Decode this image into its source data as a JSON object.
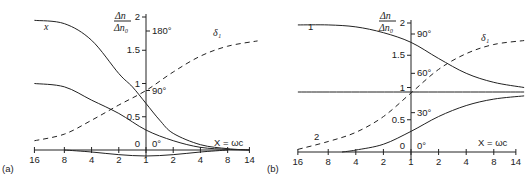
{
  "chart_data": [
    {
      "panel_label": "(a)",
      "type": "line",
      "xlabel": "X = ωc",
      "x_tick_labels": [
        "16",
        "8",
        "4",
        "2",
        "1",
        "2",
        "4",
        "8",
        "14"
      ],
      "x_ticks_note": "log scale, reciprocal left of 1, direct right of 1",
      "y_label": "Δn / Δn₀",
      "y_tick_labels": [
        "0",
        "0.5",
        "1",
        "1.5",
        "2"
      ],
      "ylim": [
        0,
        2
      ],
      "phase_tick_labels": [
        "0°",
        "90°",
        "180°"
      ],
      "phase_range_deg": [
        0,
        180
      ],
      "series": [
        {
          "name": "x",
          "style": "solid",
          "x": [
            -4.1,
            -3,
            -2,
            -1,
            -0.5,
            0,
            0.5,
            1,
            2,
            3,
            3.8
          ],
          "y": [
            1.95,
            1.9,
            1.65,
            1.15,
            0.95,
            0.7,
            0.45,
            0.25,
            0.08,
            0.02,
            0.0
          ]
        },
        {
          "name": "curve-2",
          "style": "solid",
          "x": [
            -4.1,
            -3,
            -2,
            -1,
            0,
            1,
            2,
            3,
            3.8
          ],
          "y": [
            1.0,
            0.95,
            0.75,
            0.55,
            0.3,
            0.14,
            0.04,
            0.01,
            0.0
          ]
        },
        {
          "name": "curve-3",
          "style": "solid",
          "x": [
            -3,
            -2,
            -1,
            0,
            1,
            2,
            3
          ],
          "y": [
            0.0,
            -0.03,
            -0.07,
            -0.09,
            -0.07,
            -0.03,
            0.0
          ]
        },
        {
          "name": "δ₁",
          "style": "dashed",
          "axis": "phase",
          "x": [
            -4.1,
            -3,
            -2,
            -1,
            0,
            1,
            2,
            3,
            4.1
          ],
          "y": [
            14,
            24,
            45,
            68,
            90,
            118,
            142,
            157,
            165
          ]
        }
      ],
      "annotations": [
        "x",
        "δ₁",
        "0",
        "0°",
        "90°",
        "180°"
      ]
    },
    {
      "panel_label": "(b)",
      "type": "line",
      "xlabel": "X = ωc",
      "x_tick_labels": [
        "16",
        "8",
        "4",
        "2",
        "1",
        "2",
        "4",
        "8",
        "14"
      ],
      "x_ticks_note": "log scale, reciprocal left of 1, direct right of 1",
      "y_label": "Δn / Δn₀",
      "y_tick_labels": [
        "0",
        "0.5",
        "1",
        "1.5",
        "2"
      ],
      "ylim": [
        0,
        2
      ],
      "phase_tick_labels": [
        "0°",
        "30°",
        "60°",
        "90°"
      ],
      "phase_range_deg": [
        0,
        90
      ],
      "series": [
        {
          "name": "1",
          "style": "solid",
          "x": [
            -4.1,
            -3,
            -2,
            -1,
            0,
            1,
            2,
            3,
            4.1
          ],
          "y": [
            1.97,
            1.97,
            1.94,
            1.85,
            1.7,
            1.45,
            1.22,
            1.08,
            1.0
          ]
        },
        {
          "name": "2",
          "style": "solid",
          "x": [
            -2.5,
            -2,
            -1,
            0,
            1,
            2,
            3,
            4.1
          ],
          "y": [
            0.0,
            0.03,
            0.12,
            0.32,
            0.55,
            0.72,
            0.82,
            0.87
          ]
        },
        {
          "name": "level-1",
          "style": "solid",
          "x": [
            -4.1,
            4.1
          ],
          "y": [
            0.93,
            0.93
          ]
        },
        {
          "name": "δ₁",
          "style": "dashed",
          "axis": "phase",
          "x": [
            -4.1,
            -3,
            -2,
            -1,
            0,
            1,
            2,
            3,
            4.1
          ],
          "y": [
            2,
            8,
            15,
            27,
            45,
            63,
            75,
            82,
            85
          ]
        }
      ],
      "annotations": [
        "1",
        "2",
        "δ₁",
        "0",
        "0°",
        "30°",
        "60°",
        "90°"
      ]
    }
  ]
}
